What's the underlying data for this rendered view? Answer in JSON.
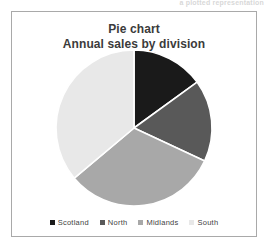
{
  "page": {
    "header_fragment": "a plotted representation"
  },
  "chart_frame": {
    "border_color": "#a9a9a9",
    "background": "#ffffff"
  },
  "chart_data": {
    "type": "pie",
    "title": "Pie chart",
    "subtitle": "Annual sales by division",
    "title_lines": [
      "Pie chart",
      "Annual sales by division"
    ],
    "categories": [
      "Scotland",
      "North",
      "Midlands",
      "South"
    ],
    "values": [
      15,
      17,
      32,
      36
    ],
    "unit": "percent",
    "start_angle_deg": 0,
    "direction": "clockwise",
    "slice_angles_deg": [
      54,
      61,
      115,
      130
    ],
    "colors": [
      "#1a1a1a",
      "#595959",
      "#a8a8a8",
      "#e8e8e8"
    ],
    "separator_color": "#ffffff",
    "legend_position": "bottom",
    "data_labels": false,
    "grid": false,
    "xlabel": "",
    "ylabel": "",
    "geometry": {
      "cx": 122,
      "cy": 80,
      "r": 78
    },
    "slices": [
      {
        "label": "Scotland",
        "value": 15,
        "angle_deg": 54,
        "color": "#1a1a1a"
      },
      {
        "label": "North",
        "value": 17,
        "angle_deg": 61,
        "color": "#595959"
      },
      {
        "label": "Midlands",
        "value": 32,
        "angle_deg": 115,
        "color": "#a8a8a8"
      },
      {
        "label": "South",
        "value": 36,
        "angle_deg": 130,
        "color": "#e8e8e8"
      }
    ]
  }
}
